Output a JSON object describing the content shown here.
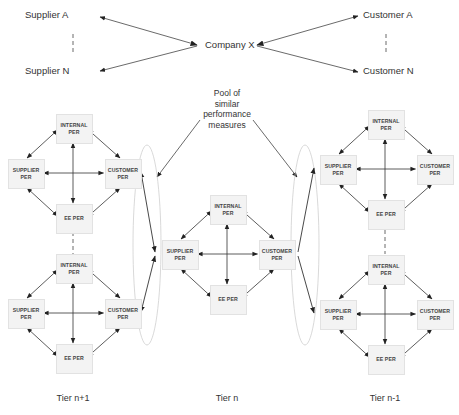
{
  "top": {
    "supplier_a": "Supplier A",
    "supplier_n": "Supplier N",
    "company": "Company X",
    "customer_a": "Customer A",
    "customer_n": "Customer N"
  },
  "pool_label": "Pool of similar performance measures",
  "pool_lines": [
    "Pool of",
    "similar",
    "performance",
    "measures"
  ],
  "box_labels": {
    "internal": [
      "INTERNAL",
      "PER"
    ],
    "supplier": [
      "SUPPLIER",
      "PER"
    ],
    "customer": [
      "CUSTOMER",
      "PER"
    ],
    "ee": [
      "EE PER"
    ]
  },
  "clusters": [
    {
      "id": "left-top",
      "tier": "n+1"
    },
    {
      "id": "left-bottom",
      "tier": "n+1"
    },
    {
      "id": "center",
      "tier": "n"
    },
    {
      "id": "right-top",
      "tier": "n-1"
    },
    {
      "id": "right-bottom",
      "tier": "n-1"
    }
  ],
  "tiers": {
    "left": "Tier n+1",
    "center": "Tier n",
    "right": "Tier n-1"
  },
  "colors": {
    "line": "#333333",
    "box_fill": "#f3f3f3",
    "box_border": "#e2e2e2",
    "ellipse": "#c8c8c8"
  }
}
